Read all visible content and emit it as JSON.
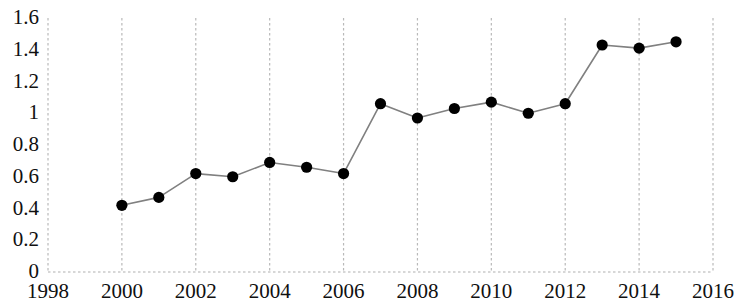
{
  "chart_data": {
    "type": "line",
    "title": "",
    "subtitle": "",
    "xlabel": "",
    "ylabel": "",
    "grid": "vertical-dashed",
    "legend": "none",
    "xlim": [
      1998,
      2016
    ],
    "ylim": [
      0,
      1.6
    ],
    "x_tick_labels": [
      "1998",
      "2000",
      "2002",
      "2004",
      "2006",
      "2008",
      "2010",
      "2012",
      "2014",
      "2016"
    ],
    "x_ticks": [
      1998,
      2000,
      2002,
      2004,
      2006,
      2008,
      2010,
      2012,
      2014,
      2016
    ],
    "y_tick_labels": [
      "0",
      "0.2",
      "0.4",
      "0.6",
      "0.8",
      "1",
      "1.2",
      "1.4",
      "1.6"
    ],
    "y_ticks": [
      0,
      0.2,
      0.4,
      0.6,
      0.8,
      1,
      1.2,
      1.4,
      1.6
    ],
    "x": [
      2000,
      2001,
      2002,
      2003,
      2004,
      2005,
      2006,
      2007,
      2008,
      2009,
      2010,
      2011,
      2012,
      2013,
      2014,
      2015
    ],
    "values": [
      0.42,
      0.47,
      0.62,
      0.6,
      0.69,
      0.66,
      0.62,
      1.06,
      0.97,
      1.03,
      1.07,
      1.0,
      1.06,
      1.43,
      1.41,
      1.45
    ],
    "series": [
      {
        "name": "series-1",
        "marker": "circle",
        "marker_color": "#000000",
        "line_color": "#7f7f7f",
        "values": [
          0.42,
          0.47,
          0.62,
          0.6,
          0.69,
          0.66,
          0.62,
          1.06,
          0.97,
          1.03,
          1.07,
          1.0,
          1.06,
          1.43,
          1.41,
          1.45
        ]
      }
    ]
  },
  "colors": {
    "marker": "#000000",
    "line": "#808080",
    "grid": "#b9b9b9",
    "axis": "#b0b0b0",
    "text": "#101010",
    "background": "#ffffff"
  }
}
